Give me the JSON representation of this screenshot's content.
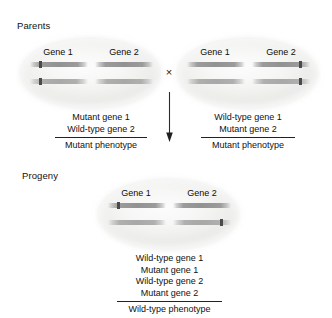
{
  "figure": {
    "sections": {
      "parents_label": "Parents",
      "progeny_label": "Progeny"
    },
    "cross_symbol": "×"
  },
  "cells": {
    "parent_left": {
      "name": "Parent 1",
      "gene_headings": [
        "Gene 1",
        "Gene 2"
      ],
      "chromosomes": [
        {
          "gene1_mutant": true,
          "gene2_mutant": false
        },
        {
          "gene1_mutant": true,
          "gene2_mutant": false
        }
      ]
    },
    "parent_right": {
      "name": "Parent 2",
      "gene_headings": [
        "Gene 1",
        "Gene 2"
      ],
      "chromosomes": [
        {
          "gene1_mutant": false,
          "gene2_mutant": true
        },
        {
          "gene1_mutant": false,
          "gene2_mutant": true
        }
      ]
    },
    "progeny": {
      "name": "Progeny",
      "gene_headings": [
        "Gene 1",
        "Gene 2"
      ],
      "chromosomes": [
        {
          "gene1_mutant": true,
          "gene2_mutant": false
        },
        {
          "gene1_mutant": false,
          "gene2_mutant": true
        }
      ]
    }
  },
  "genotypes": {
    "parent_left": {
      "lines": [
        "Mutant gene 1",
        "Wild-type gene 2"
      ],
      "phenotype": "Mutant phenotype"
    },
    "parent_right": {
      "lines": [
        "Wild-type gene 1",
        "Mutant gene 2"
      ],
      "phenotype": "Mutant phenotype"
    },
    "progeny": {
      "lines": [
        "Wild-type gene 1",
        "Mutant gene 1",
        "Wild-type gene 2",
        "Mutant gene 2"
      ],
      "phenotype": "Wild-type phenotype"
    }
  },
  "colors": {
    "background": "#ffffff",
    "text": "#111111",
    "chromosome": "#929292",
    "mutation_mark": "#4a4a4a",
    "cell_fill": "#f2f2f0"
  }
}
